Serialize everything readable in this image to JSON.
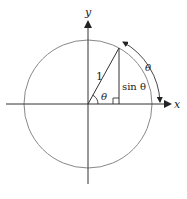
{
  "diagram": {
    "axes": {
      "x_label": "x",
      "y_label": "y"
    },
    "labels": {
      "radius": "1",
      "angle": "θ",
      "opposite": "sin θ",
      "arc": "θ"
    },
    "colors": {
      "stroke": "#333333",
      "circle": "#888888",
      "background": "#ffffff"
    }
  }
}
